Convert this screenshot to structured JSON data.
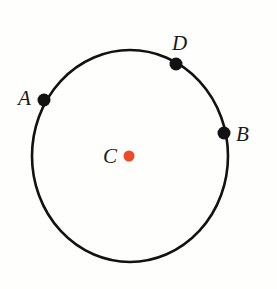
{
  "figure": {
    "type": "geometry-diagram",
    "background_color": "#fefefd",
    "stroke_color": "#121212",
    "label_color": "#1a1a1a",
    "center_dot_color": "#ef4a23",
    "point_dot_color": "#121212",
    "canvas": {
      "width": 277,
      "height": 289
    }
  },
  "circle": {
    "name": "circle-outline",
    "center_x": 130,
    "center_y": 156,
    "radius_x": 98,
    "radius_y": 106,
    "stroke_width": 2.6
  },
  "center_point": {
    "label": "C",
    "dot_x": 129,
    "dot_y": 156,
    "dot_radius": 5.5,
    "label_x": 103,
    "label_y": 163,
    "font_size": 21,
    "color": "#ef4a23"
  },
  "points": [
    {
      "label": "A",
      "dot_x": 44,
      "dot_y": 100,
      "dot_radius": 6.5,
      "label_x": 18,
      "label_y": 105,
      "font_size": 21
    },
    {
      "label": "D",
      "dot_x": 176,
      "dot_y": 64,
      "dot_radius": 6.5,
      "label_x": 172,
      "label_y": 50,
      "font_size": 21
    },
    {
      "label": "B",
      "dot_x": 224,
      "dot_y": 133,
      "dot_radius": 6.5,
      "label_x": 236,
      "label_y": 141,
      "font_size": 21
    }
  ],
  "chart_data": {
    "type": "scatter",
    "xlabel": "",
    "ylabel": "",
    "xlim": [
      0,
      277
    ],
    "ylim": [
      0,
      289
    ],
    "grid": false,
    "legend": "none",
    "shapes": [
      {
        "kind": "circle",
        "name": "main-circle",
        "center": [
          130,
          156
        ],
        "radius_x": 98,
        "radius_y": 106,
        "stroke": "#121212",
        "fill": "none"
      }
    ],
    "labels": [
      "C",
      "A",
      "D",
      "B"
    ],
    "points": [
      {
        "label": "C",
        "x": 129,
        "y": 156,
        "role": "center",
        "color": "#ef4a23"
      },
      {
        "label": "A",
        "x": 44,
        "y": 100,
        "role": "on-circle",
        "color": "#121212"
      },
      {
        "label": "D",
        "x": 176,
        "y": 64,
        "role": "on-circle",
        "color": "#121212"
      },
      {
        "label": "B",
        "x": 224,
        "y": 133,
        "role": "on-circle",
        "color": "#121212"
      }
    ],
    "annotations": [
      {
        "text": "A",
        "x": 18,
        "y": 105
      },
      {
        "text": "D",
        "x": 172,
        "y": 50
      },
      {
        "text": "B",
        "x": 236,
        "y": 141
      },
      {
        "text": "C",
        "x": 103,
        "y": 163
      }
    ]
  }
}
